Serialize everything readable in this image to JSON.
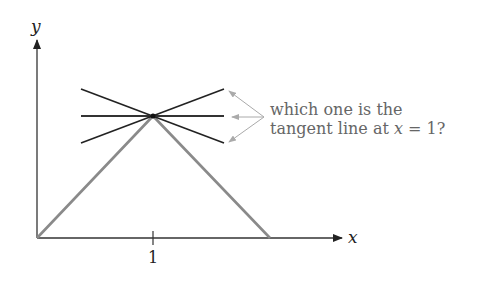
{
  "diagram": {
    "axes": {
      "x_label": "x",
      "y_label": "y",
      "tick_label": "1"
    },
    "question": {
      "line1": "which one is the",
      "line2_prefix": "tangent line at ",
      "line2_var": "x",
      "line2_suffix": " = 1?"
    },
    "colors": {
      "axis": "#333333",
      "graph": "#8a8a8a",
      "candidate_lines": "#222222",
      "arrows": "#aaaaaa",
      "text": "#666666"
    },
    "candidate_lines": [
      {
        "name": "negative-slope",
        "x1": 81,
        "y1": 89,
        "x2": 224,
        "y2": 143
      },
      {
        "name": "horizontal",
        "x1": 81,
        "y1": 116,
        "x2": 224,
        "y2": 116
      },
      {
        "name": "positive-slope",
        "x1": 81,
        "y1": 143,
        "x2": 224,
        "y2": 89
      }
    ]
  }
}
